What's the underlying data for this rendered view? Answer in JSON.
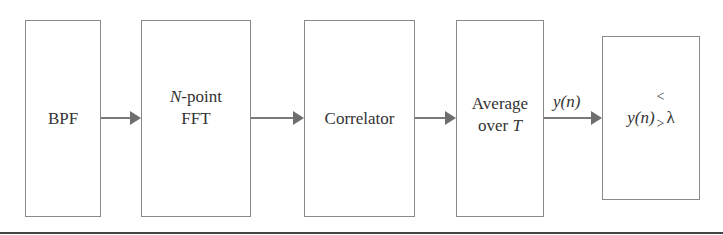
{
  "diagram": {
    "type": "block-diagram",
    "blocks": [
      {
        "id": "bpf",
        "label": "BPF"
      },
      {
        "id": "fft",
        "label_italic": "N",
        "label_rest": "-point",
        "line2": "FFT"
      },
      {
        "id": "correlator",
        "label": "Correlator"
      },
      {
        "id": "average",
        "line1": "Average",
        "line2_plain": "over ",
        "line2_italic": "T"
      },
      {
        "id": "threshold",
        "lhs": "y(n)",
        "cmp_top": "<",
        "cmp_bottom": ">",
        "rhs": "λ"
      }
    ],
    "edges": [
      {
        "from": "bpf",
        "to": "fft",
        "label": ""
      },
      {
        "from": "fft",
        "to": "correlator",
        "label": ""
      },
      {
        "from": "correlator",
        "to": "average",
        "label": ""
      },
      {
        "from": "average",
        "to": "threshold",
        "label": "y(n)"
      }
    ],
    "colors": {
      "stroke": "#8a8a8a",
      "arrow": "#6e6e6e",
      "text": "#333333"
    }
  }
}
